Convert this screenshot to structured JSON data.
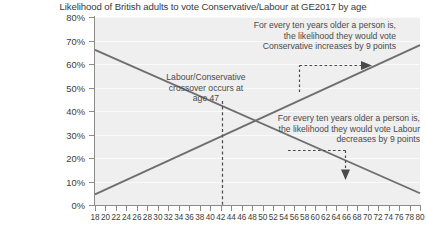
{
  "chart_data": {
    "type": "line",
    "title": "Likelihood of British adults to vote Conservative/Labour at GE2017 by age",
    "xlabel": "",
    "ylabel": "",
    "xlim": [
      18,
      80
    ],
    "ylim": [
      0,
      80
    ],
    "grid": true,
    "legend_position": "none",
    "x_tick_labels": [
      "18",
      "20",
      "22",
      "24",
      "26",
      "28",
      "30",
      "32",
      "34",
      "36",
      "38",
      "40",
      "42",
      "44",
      "46",
      "48",
      "50",
      "52",
      "54",
      "56",
      "58",
      "60",
      "62",
      "64",
      "66",
      "68",
      "70",
      "72",
      "74",
      "76",
      "78",
      "80"
    ],
    "y_tick_labels": [
      "0%",
      "10%",
      "20%",
      "30%",
      "40%",
      "50%",
      "60%",
      "70%",
      "80%"
    ],
    "y_tick_values": [
      0,
      10,
      20,
      30,
      40,
      50,
      60,
      70,
      80
    ],
    "series": [
      {
        "name": "Conservative",
        "color": "#6e6e6e",
        "x": [
          18,
          80
        ],
        "values": [
          4.5,
          68.0
        ]
      },
      {
        "name": "Labour",
        "color": "#6e6e6e",
        "x": [
          18,
          80
        ],
        "values": [
          66.0,
          5.0
        ]
      }
    ],
    "annotations": [
      {
        "name": "conservative-trend-note",
        "text": "For every ten years older a person is,\nthe likelihood they would vote\nConservative increases by 9 points"
      },
      {
        "name": "crossover-note",
        "text": "Labour/Conservative\ncrossover occurs at\nage 47"
      },
      {
        "name": "labour-trend-note",
        "text": "For every ten years older a person is,\nthe likelihood they would vote Labour\ndecreases by 9 points"
      }
    ],
    "crossover": {
      "age": 47,
      "value": 36
    }
  },
  "colors": {
    "plot_background": "#efefef",
    "gridline": "#fafafa",
    "axis": "#8b8b8b",
    "line": "#6e6e6e",
    "text": "#3c3c3c",
    "annotation_text": "#4a4a4a",
    "callout": "#4a4a4a"
  }
}
